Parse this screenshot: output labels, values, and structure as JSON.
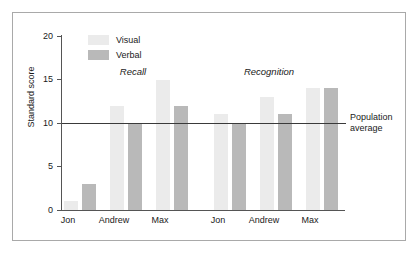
{
  "chart_data": {
    "type": "bar",
    "title": "",
    "xlabel": "",
    "ylabel": "Standard score",
    "ylim": [
      0,
      20
    ],
    "yticks": [
      0,
      5,
      10,
      15,
      20
    ],
    "ytick_labels": [
      "0",
      "5",
      "10",
      "15",
      "20"
    ],
    "grid": false,
    "legend_position": "top-left-inside",
    "categories": [
      "Jon",
      "Andrew",
      "Max",
      "Jon",
      "Andrew",
      "Max"
    ],
    "groups": [
      {
        "label": "Recall",
        "categories": [
          "Jon",
          "Andrew",
          "Max"
        ],
        "series": [
          {
            "name": "Visual",
            "values": [
              1,
              12,
              15
            ]
          },
          {
            "name": "Verbal",
            "values": [
              3,
              10,
              12
            ]
          }
        ]
      },
      {
        "label": "Recognition",
        "categories": [
          "Jon",
          "Andrew",
          "Max"
        ],
        "series": [
          {
            "name": "Visual",
            "values": [
              11,
              13,
              14
            ]
          },
          {
            "name": "Verbal",
            "values": [
              10,
              11,
              14
            ]
          }
        ]
      }
    ],
    "series": [
      {
        "name": "Visual",
        "values": [
          1,
          12,
          15,
          11,
          13,
          14
        ],
        "color": "#ebebeb"
      },
      {
        "name": "Verbal",
        "values": [
          3,
          10,
          12,
          10,
          11,
          14
        ],
        "color": "#b9b9b9"
      }
    ],
    "annotations": [
      {
        "name": "population-average",
        "value": 10,
        "line1": "Population",
        "line2": "average"
      }
    ]
  },
  "legend": {
    "items": [
      {
        "label": "Visual",
        "color": "#ebebeb"
      },
      {
        "label": "Verbal",
        "color": "#b9b9b9"
      }
    ]
  },
  "axes": {
    "y_title": "Standard score",
    "y_ticks": [
      "20",
      "15",
      "10",
      "5",
      "0"
    ],
    "x_labels": [
      "Jon",
      "Andrew",
      "Max",
      "Jon",
      "Andrew",
      "Max"
    ]
  },
  "group_titles": [
    "Recall",
    "Recognition"
  ],
  "reference": {
    "line1": "Population",
    "line2": "average"
  }
}
